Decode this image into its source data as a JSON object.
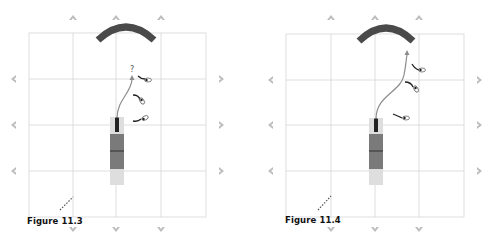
{
  "figures": [
    {
      "caption": "Figure 11.3",
      "path_end_label": "?",
      "description": "Shot path ending short with question mark; three observers beside path"
    },
    {
      "caption": "Figure 11.4",
      "path_end_label": "",
      "description": "Shot path curving right up to the arc; three observers beside path"
    }
  ],
  "colors": {
    "grid": "#d6d6d6",
    "arc": "#4a4a4a",
    "arrow_marker": "#b5b5b5",
    "path": "#8c8c8c",
    "block_dark": "#7a7a7a",
    "block_light": "#dcdcdc",
    "center_line": "#333333"
  },
  "markers": {
    "top": [
      "up-arrow",
      "up-arrow",
      "up-arrow"
    ],
    "left": [
      "left-arrow",
      "left-arrow",
      "left-arrow"
    ],
    "right": [
      "right-arrow",
      "right-arrow",
      "right-arrow"
    ],
    "bottom": [
      "down-arrow",
      "down-arrow",
      "down-arrow"
    ]
  }
}
